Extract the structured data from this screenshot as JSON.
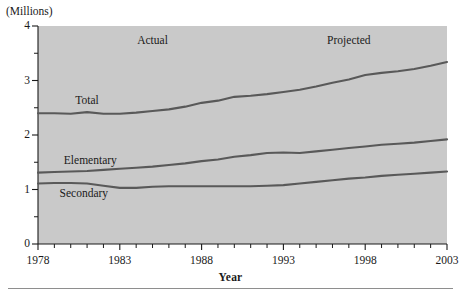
{
  "figure": {
    "units_label": "(Millions)",
    "xaxis_title": "Year",
    "panel_color": "#c9c9c9",
    "line_color": "#595959",
    "axis_color": "#1a1a1a"
  },
  "annotations": {
    "actual": "Actual",
    "projected": "Projected",
    "total": "Total",
    "elementary": "Elementary",
    "secondary": "Secondary"
  },
  "axes": {
    "y_major_labels": [
      "0",
      "1",
      "2",
      "3",
      "4"
    ],
    "y_major_values": [
      0,
      1,
      2,
      3,
      4
    ],
    "y_minor_values": [
      0.5,
      1.5,
      2.5,
      3.5
    ],
    "x_major_labels": [
      "1978",
      "1983",
      "1988",
      "1993",
      "1998",
      "2003"
    ],
    "x_major_values": [
      1978,
      1983,
      1988,
      1993,
      1998,
      2003
    ]
  },
  "chart_data": {
    "type": "line",
    "title": "",
    "subtitle": "",
    "xlabel": "Year",
    "ylabel": "(Millions)",
    "xlim": [
      1978,
      2003
    ],
    "ylim": [
      0,
      4
    ],
    "grid": false,
    "legend": "inline-labels",
    "annotations": [
      {
        "text": "Actual",
        "x": 1985,
        "y": 3.72
      },
      {
        "text": "Projected",
        "x": 1997,
        "y": 3.72
      },
      {
        "text": "Total",
        "x": 1981,
        "y": 2.62
      },
      {
        "text": "Elementary",
        "x": 1981.2,
        "y": 1.52
      },
      {
        "text": "Secondary",
        "x": 1980.8,
        "y": 0.92
      }
    ],
    "x": [
      1978,
      1979,
      1980,
      1981,
      1982,
      1983,
      1984,
      1985,
      1986,
      1987,
      1988,
      1989,
      1990,
      1991,
      1992,
      1993,
      1994,
      1995,
      1996,
      1997,
      1998,
      1999,
      2000,
      2001,
      2002,
      2003
    ],
    "series": [
      {
        "name": "Total",
        "values": [
          2.4,
          2.4,
          2.39,
          2.42,
          2.39,
          2.39,
          2.41,
          2.44,
          2.47,
          2.52,
          2.59,
          2.63,
          2.7,
          2.72,
          2.75,
          2.79,
          2.83,
          2.89,
          2.96,
          3.02,
          3.1,
          3.14,
          3.17,
          3.21,
          3.27,
          3.34
        ]
      },
      {
        "name": "Elementary",
        "values": [
          1.31,
          1.32,
          1.33,
          1.34,
          1.36,
          1.38,
          1.4,
          1.42,
          1.45,
          1.48,
          1.52,
          1.55,
          1.6,
          1.63,
          1.67,
          1.68,
          1.67,
          1.7,
          1.73,
          1.76,
          1.79,
          1.82,
          1.84,
          1.86,
          1.89,
          1.92
        ]
      },
      {
        "name": "Secondary",
        "values": [
          1.11,
          1.12,
          1.12,
          1.11,
          1.07,
          1.03,
          1.03,
          1.05,
          1.06,
          1.06,
          1.06,
          1.06,
          1.06,
          1.06,
          1.07,
          1.08,
          1.11,
          1.14,
          1.17,
          1.2,
          1.22,
          1.25,
          1.27,
          1.29,
          1.31,
          1.33
        ]
      }
    ]
  }
}
